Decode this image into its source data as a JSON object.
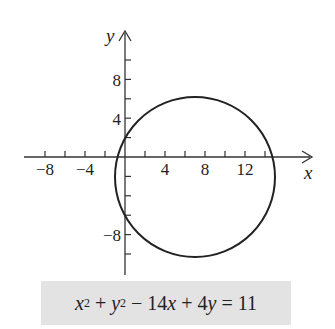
{
  "chart_data": {
    "type": "line",
    "title": "",
    "xlabel": "x",
    "ylabel": "y",
    "x_tick_labels": [
      "-8",
      "-4",
      "4",
      "8",
      "12"
    ],
    "y_tick_labels": [
      "8",
      "4",
      "-8"
    ],
    "x_ticks_minor_step": 2,
    "y_ticks_minor_step": 2,
    "xlim": [
      -10,
      16
    ],
    "ylim": [
      -12,
      12
    ],
    "grid": false,
    "series": [
      {
        "name": "circle",
        "shape": "circle",
        "center": [
          7,
          -2
        ],
        "radius": 8,
        "equation": "x^2 + y^2 - 14x + 4y = 11"
      }
    ],
    "annotation": "x² + y² − 14x + 4y = 11"
  },
  "axes": {
    "x_label": "x",
    "y_label": "y"
  },
  "ticks": {
    "x": [
      {
        "v": -8,
        "label": "−8"
      },
      {
        "v": -4,
        "label": "−4"
      },
      {
        "v": 4,
        "label": "4"
      },
      {
        "v": 8,
        "label": "8"
      },
      {
        "v": 12,
        "label": "12"
      }
    ],
    "y": [
      {
        "v": 8,
        "label": "8"
      },
      {
        "v": 4,
        "label": "4"
      },
      {
        "v": -8,
        "label": "−8"
      }
    ]
  },
  "equation": {
    "x": "x",
    "y": "y",
    "exp": "2",
    "rest1": " + ",
    "rest2": " − 14",
    "rest3": " + 4",
    "rest4": " = 11"
  }
}
